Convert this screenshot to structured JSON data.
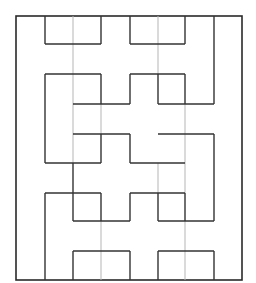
{
  "maze": {
    "frame": {
      "x": 16,
      "y": 16,
      "width": 226,
      "height": 264
    },
    "colors": {
      "dark": "#333333",
      "light": "#b5b5b5",
      "background": "#ffffff"
    },
    "dark_walls": [
      [
        45,
        16,
        45,
        44
      ],
      [
        101,
        16,
        101,
        44
      ],
      [
        45,
        44,
        101,
        44
      ],
      [
        130,
        16,
        130,
        44
      ],
      [
        185,
        16,
        185,
        44
      ],
      [
        130,
        44,
        185,
        44
      ],
      [
        45,
        74,
        101,
        74
      ],
      [
        45,
        74,
        45,
        163
      ],
      [
        101,
        74,
        101,
        104
      ],
      [
        130,
        74,
        185,
        74
      ],
      [
        130,
        74,
        130,
        104
      ],
      [
        185,
        74,
        185,
        104
      ],
      [
        73,
        104,
        130,
        104
      ],
      [
        158,
        104,
        214,
        104
      ],
      [
        214,
        16,
        214,
        104
      ],
      [
        158,
        74,
        158,
        104
      ],
      [
        73,
        134,
        130,
        134
      ],
      [
        158,
        134,
        214,
        134
      ],
      [
        214,
        134,
        214,
        221
      ],
      [
        45,
        163,
        101,
        163
      ],
      [
        101,
        134,
        101,
        163
      ],
      [
        130,
        163,
        185,
        163
      ],
      [
        130,
        134,
        130,
        163
      ],
      [
        45,
        193,
        101,
        193
      ],
      [
        45,
        193,
        45,
        280
      ],
      [
        101,
        193,
        101,
        221
      ],
      [
        130,
        193,
        185,
        193
      ],
      [
        130,
        193,
        130,
        221
      ],
      [
        185,
        193,
        185,
        221
      ],
      [
        73,
        163,
        73,
        221
      ],
      [
        73,
        221,
        130,
        221
      ],
      [
        158,
        221,
        214,
        221
      ],
      [
        158,
        193,
        158,
        221
      ],
      [
        73,
        251,
        130,
        251
      ],
      [
        158,
        251,
        214,
        251
      ],
      [
        214,
        251,
        214,
        280
      ],
      [
        158,
        251,
        158,
        280
      ],
      [
        73,
        251,
        73,
        280
      ],
      [
        130,
        251,
        130,
        280
      ]
    ],
    "light_walls": [
      [
        73,
        16,
        73,
        134
      ],
      [
        158,
        16,
        158,
        74
      ],
      [
        185,
        104,
        185,
        193
      ],
      [
        101,
        221,
        101,
        280
      ],
      [
        185,
        221,
        185,
        280
      ],
      [
        101,
        104,
        101,
        134
      ],
      [
        73,
        134,
        73,
        163
      ],
      [
        158,
        163,
        158,
        193
      ]
    ]
  }
}
